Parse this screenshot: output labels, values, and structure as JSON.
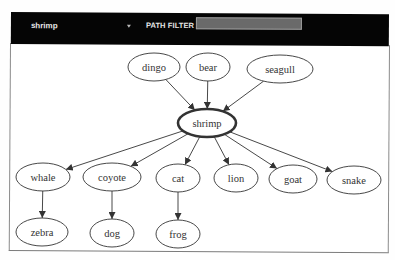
{
  "toolbar": {
    "node_select": {
      "selected": "shrimp"
    },
    "path_filter": {
      "label": "PATH FILTER",
      "value": "",
      "placeholder": ""
    }
  },
  "graph": {
    "focus_node": "shrimp",
    "nodes": [
      {
        "id": "dingo",
        "label": "dingo",
        "cx": 154,
        "cy": 67,
        "rx": 26,
        "ry": 14
      },
      {
        "id": "bear",
        "label": "bear",
        "cx": 208,
        "cy": 67,
        "rx": 22,
        "ry": 14
      },
      {
        "id": "seagull",
        "label": "seagull",
        "cx": 280,
        "cy": 69,
        "rx": 33,
        "ry": 14
      },
      {
        "id": "shrimp",
        "label": "shrimp",
        "cx": 207,
        "cy": 123,
        "rx": 29,
        "ry": 14,
        "focus": true
      },
      {
        "id": "whale",
        "label": "whale",
        "cx": 43,
        "cy": 177,
        "rx": 27,
        "ry": 14
      },
      {
        "id": "coyote",
        "label": "coyote",
        "cx": 112,
        "cy": 177,
        "rx": 29,
        "ry": 14
      },
      {
        "id": "cat",
        "label": "cat",
        "cx": 178,
        "cy": 178,
        "rx": 22,
        "ry": 14
      },
      {
        "id": "lion",
        "label": "lion",
        "cx": 236,
        "cy": 178,
        "rx": 22,
        "ry": 14
      },
      {
        "id": "goat",
        "label": "goat",
        "cx": 293,
        "cy": 179,
        "rx": 24,
        "ry": 14
      },
      {
        "id": "snake",
        "label": "snake",
        "cx": 354,
        "cy": 180,
        "rx": 27,
        "ry": 14
      },
      {
        "id": "zebra",
        "label": "zebra",
        "cx": 42,
        "cy": 232,
        "rx": 26,
        "ry": 14
      },
      {
        "id": "dog",
        "label": "dog",
        "cx": 112,
        "cy": 233,
        "rx": 22,
        "ry": 14
      },
      {
        "id": "frog",
        "label": "frog",
        "cx": 178,
        "cy": 234,
        "rx": 22,
        "ry": 14
      }
    ],
    "edges": [
      {
        "from": "dingo",
        "to": "shrimp"
      },
      {
        "from": "bear",
        "to": "shrimp"
      },
      {
        "from": "seagull",
        "to": "shrimp"
      },
      {
        "from": "shrimp",
        "to": "whale"
      },
      {
        "from": "shrimp",
        "to": "coyote"
      },
      {
        "from": "shrimp",
        "to": "cat"
      },
      {
        "from": "shrimp",
        "to": "lion"
      },
      {
        "from": "shrimp",
        "to": "goat"
      },
      {
        "from": "shrimp",
        "to": "snake"
      },
      {
        "from": "whale",
        "to": "zebra"
      },
      {
        "from": "coyote",
        "to": "dog"
      },
      {
        "from": "cat",
        "to": "frog"
      }
    ]
  },
  "colors": {
    "header_bg": "#050505",
    "header_text": "#e8e8e8",
    "filter_input_bg": "#6a6a6a",
    "node_stroke": "#333333",
    "edge_stroke": "#333333",
    "panel_border": "#8a8a8a"
  }
}
